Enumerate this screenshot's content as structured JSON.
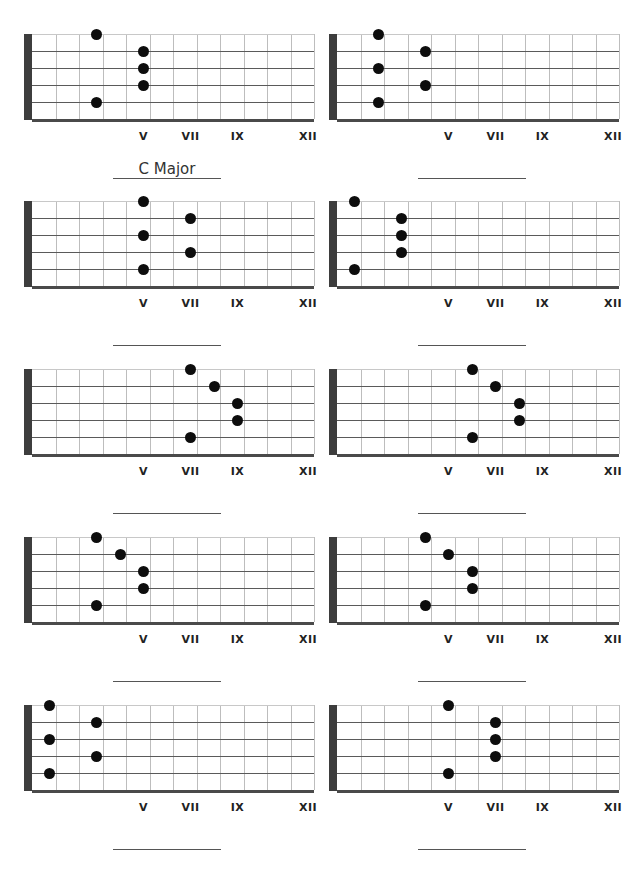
{
  "worksheet": {
    "layout": {
      "columns": 2,
      "rows": 5,
      "frets_shown": 12,
      "strings": 6
    },
    "fret_markers": [
      {
        "label": "V",
        "fret": 5
      },
      {
        "label": "VII",
        "fret": 7
      },
      {
        "label": "IX",
        "fret": 9
      },
      {
        "label": "XII",
        "fret": 12
      }
    ],
    "colors": {
      "nut": "#3d3d3d",
      "fret": "#bdbdbd",
      "string": "#5a5a5a",
      "dot": "#0d0d0d",
      "text": "#222222"
    },
    "diagrams": [
      {
        "name": "C Major",
        "dots": [
          [
            1,
            3
          ],
          [
            2,
            5
          ],
          [
            3,
            5
          ],
          [
            4,
            5
          ],
          [
            5,
            3
          ]
        ]
      },
      {
        "name": "",
        "dots": [
          [
            1,
            2
          ],
          [
            2,
            4
          ],
          [
            3,
            2
          ],
          [
            4,
            4
          ],
          [
            5,
            2
          ]
        ]
      },
      {
        "name": "",
        "dots": [
          [
            1,
            5
          ],
          [
            2,
            7
          ],
          [
            3,
            5
          ],
          [
            4,
            7
          ],
          [
            5,
            5
          ]
        ]
      },
      {
        "name": "",
        "dots": [
          [
            1,
            1
          ],
          [
            2,
            3
          ],
          [
            3,
            3
          ],
          [
            4,
            3
          ],
          [
            5,
            1
          ]
        ]
      },
      {
        "name": "",
        "dots": [
          [
            1,
            7
          ],
          [
            2,
            8
          ],
          [
            3,
            9
          ],
          [
            4,
            9
          ],
          [
            5,
            7
          ]
        ]
      },
      {
        "name": "",
        "dots": [
          [
            1,
            6
          ],
          [
            2,
            7
          ],
          [
            3,
            8
          ],
          [
            4,
            8
          ],
          [
            5,
            6
          ]
        ]
      },
      {
        "name": "",
        "dots": [
          [
            1,
            3
          ],
          [
            2,
            4
          ],
          [
            3,
            5
          ],
          [
            4,
            5
          ],
          [
            5,
            3
          ]
        ]
      },
      {
        "name": "",
        "dots": [
          [
            1,
            4
          ],
          [
            2,
            5
          ],
          [
            3,
            6
          ],
          [
            4,
            6
          ],
          [
            5,
            4
          ]
        ]
      },
      {
        "name": "",
        "dots": [
          [
            1,
            1
          ],
          [
            2,
            3
          ],
          [
            3,
            1
          ],
          [
            4,
            3
          ],
          [
            5,
            1
          ]
        ]
      },
      {
        "name": "",
        "dots": [
          [
            1,
            5
          ],
          [
            2,
            7
          ],
          [
            3,
            7
          ],
          [
            4,
            7
          ],
          [
            5,
            5
          ]
        ]
      }
    ]
  }
}
